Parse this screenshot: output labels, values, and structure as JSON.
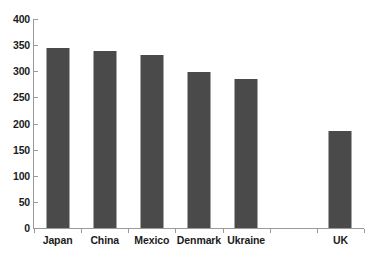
{
  "chart_data": {
    "type": "bar",
    "title": "",
    "subtitle": "",
    "xlabel": "",
    "ylabel": "",
    "categories": [
      "Japan",
      "China",
      "Mexico",
      "Denmark",
      "Ukraine",
      "",
      "UK"
    ],
    "values": [
      345,
      339,
      332,
      299,
      285,
      null,
      185
    ],
    "ylim": [
      0,
      400
    ],
    "yticks": [
      0,
      50,
      100,
      150,
      200,
      250,
      300,
      350,
      400
    ],
    "ytick_labels": [
      "0",
      "50",
      "100",
      "150",
      "200",
      "250",
      "300",
      "350",
      "400"
    ],
    "grid": false,
    "legend": null,
    "series": [
      {
        "name": "",
        "values": [
          345,
          339,
          332,
          299,
          285,
          null,
          185
        ]
      }
    ],
    "bar_color": "#4a4a4a",
    "axis_color": "#9a9a9a",
    "background_color": "#ffffff",
    "text_color": "#1b1b1b"
  }
}
